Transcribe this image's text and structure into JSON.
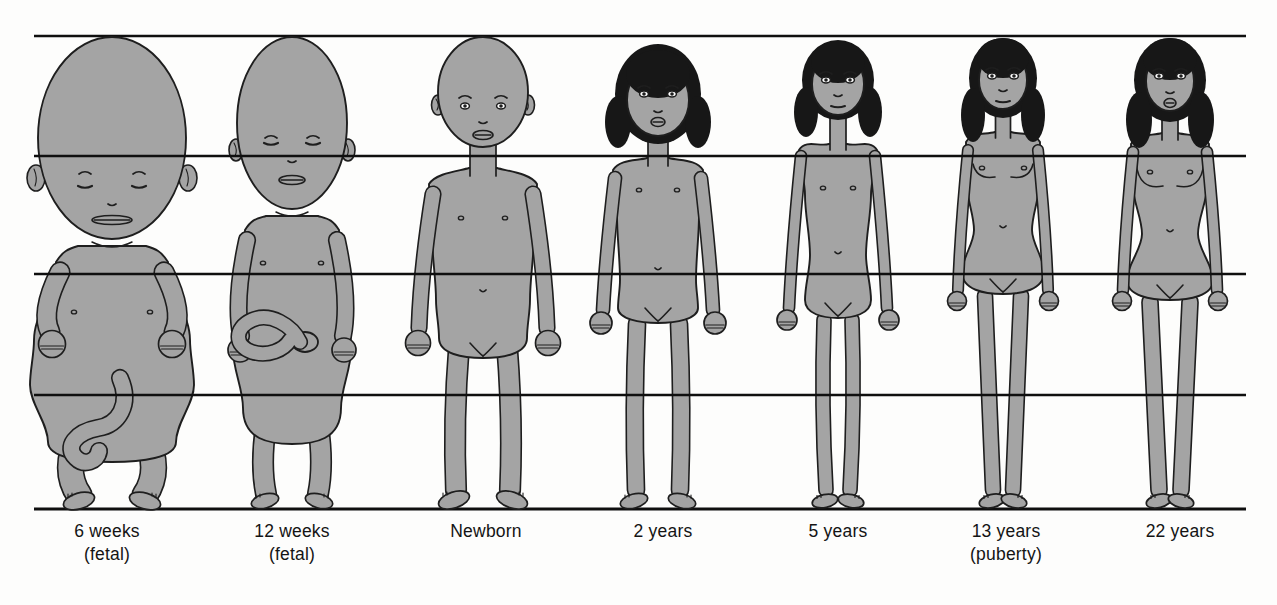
{
  "diagram": {
    "kind": "human-body-proportions-growth-stages",
    "colors": {
      "background": "#fdfdfc",
      "body_fill": "#a4a4a4",
      "outline": "#1e1e1e",
      "hair": "#171717",
      "grid_line": "#0f0f0f",
      "label_text": "#141414"
    },
    "grid": {
      "horizontal_line_count": 5
    },
    "stages": [
      {
        "id": "six-weeks-fetal",
        "label": "6 weeks",
        "sublabel": "(fetal)",
        "head_fraction_of_height": 0.43,
        "hair": false,
        "eyes": "closed",
        "umbilical_cord": true
      },
      {
        "id": "twelve-weeks-fetal",
        "label": "12 weeks",
        "sublabel": "(fetal)",
        "head_fraction_of_height": 0.37,
        "hair": false,
        "eyes": "closed",
        "umbilical_cord": true
      },
      {
        "id": "newborn",
        "label": "Newborn",
        "sublabel": "",
        "head_fraction_of_height": 0.25,
        "hair": false,
        "eyes": "open",
        "umbilical_cord": false
      },
      {
        "id": "two-years",
        "label": "2 years",
        "sublabel": "",
        "head_fraction_of_height": 0.2,
        "hair": true,
        "eyes": "open",
        "umbilical_cord": false
      },
      {
        "id": "five-years",
        "label": "5 years",
        "sublabel": "",
        "head_fraction_of_height": 0.17,
        "hair": true,
        "eyes": "open",
        "umbilical_cord": false
      },
      {
        "id": "thirteen-years",
        "label": "13 years",
        "sublabel": "(puberty)",
        "head_fraction_of_height": 0.16,
        "hair": true,
        "eyes": "open",
        "umbilical_cord": false
      },
      {
        "id": "twenty-two-years",
        "label": "22 years",
        "sublabel": "",
        "head_fraction_of_height": 0.16,
        "hair": true,
        "eyes": "open",
        "umbilical_cord": false
      }
    ]
  }
}
